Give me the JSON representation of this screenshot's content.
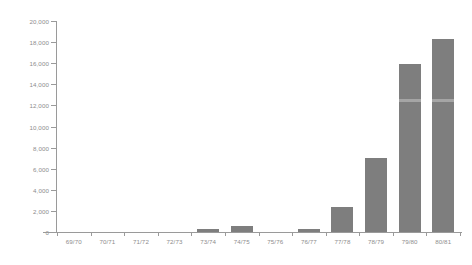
{
  "chart_data": {
    "type": "bar",
    "title": "",
    "subtitle": "",
    "xlabel": "",
    "ylabel": "",
    "categories": [
      "69/70",
      "70/71",
      "71/72",
      "72/73",
      "73/74",
      "74/75",
      "75/76",
      "76/77",
      "77/78",
      "78/79",
      "79/80",
      "80/81"
    ],
    "values": [
      0,
      0,
      0,
      0,
      300,
      600,
      0,
      300,
      2400,
      7000,
      15900,
      18300
    ],
    "series": [
      {
        "name": "",
        "values": [
          0,
          0,
          0,
          0,
          300,
          600,
          0,
          300,
          2400,
          7000,
          15900,
          18300
        ]
      }
    ],
    "ylim": [
      0,
      20000
    ],
    "ytick_step": 2000,
    "ytick_labels": [
      "0",
      "2,000",
      "4,000",
      "6,000",
      "8,000",
      "10,000",
      "12,000",
      "14,000",
      "16,000",
      "18,000",
      "20,000"
    ],
    "ytick_values": [
      0,
      2000,
      4000,
      6000,
      8000,
      10000,
      12000,
      14000,
      16000,
      18000,
      20000
    ],
    "grid": false,
    "legend": null,
    "legend_position": "none",
    "bar_color": "#7e7e7e",
    "axis_color": "#9a9a9a",
    "label_color": "#8d8d8d",
    "background_color": "#ffffff",
    "annotations": []
  }
}
